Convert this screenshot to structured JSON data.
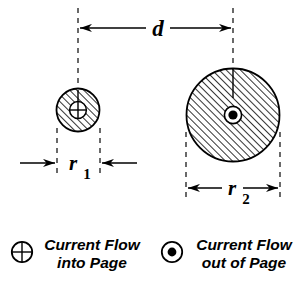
{
  "figure": {
    "background_color": "#ffffff",
    "line_color": "#000000",
    "width": 308,
    "height": 286
  },
  "dimensions": {
    "separation": {
      "label": "d",
      "name": "center-to-center-separation",
      "arrow_style": "double-headed-outward-pointing-inward"
    },
    "radius_small": {
      "label": "r",
      "subscript": "1",
      "name": "small-conductor-radius"
    },
    "radius_large": {
      "label": "r",
      "subscript": "2",
      "name": "large-conductor-radius"
    }
  },
  "conductors": [
    {
      "id": "small-conductor",
      "name": "small-hatched-conductor",
      "center_x": 78,
      "center_y": 110,
      "radius": 22,
      "fill": "diagonal-hatch",
      "symbol": "circle-plus",
      "symbol_meaning": "current into page"
    },
    {
      "id": "large-conductor",
      "name": "large-hatched-conductor",
      "center_x": 233,
      "center_y": 115,
      "radius": 47,
      "fill": "diagonal-hatch",
      "symbol": "circle-dot",
      "symbol_meaning": "current out of page"
    }
  ],
  "legend": {
    "items": [
      {
        "symbol": "circle-plus-icon",
        "line1": "Current Flow",
        "line2": "into Page"
      },
      {
        "symbol": "circle-dot-icon",
        "line1": "Current Flow",
        "line2": "out of Page"
      }
    ]
  }
}
